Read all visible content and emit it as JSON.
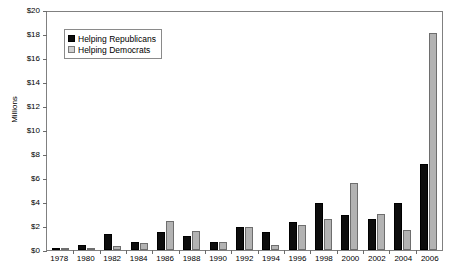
{
  "chart_data": {
    "type": "bar",
    "title": "",
    "xlabel": "",
    "ylabel": "Millions",
    "ylim": [
      0,
      20
    ],
    "ytick_labels": [
      "$0",
      "$2",
      "$4",
      "$6",
      "$8",
      "$10",
      "$12",
      "$14",
      "$16",
      "$18",
      "$20"
    ],
    "ytick_values": [
      0,
      2,
      4,
      6,
      8,
      10,
      12,
      14,
      16,
      18,
      20
    ],
    "grid": false,
    "legend_position": "top-left",
    "categories": [
      "1978",
      "1980",
      "1982",
      "1984",
      "1986",
      "1988",
      "1990",
      "1992",
      "1994",
      "1996",
      "1998",
      "2000",
      "2002",
      "2004",
      "2006"
    ],
    "series": [
      {
        "name": "Helping Republicans",
        "color": "#0d0d0d",
        "values": [
          0.15,
          0.45,
          1.35,
          0.7,
          1.5,
          1.15,
          0.7,
          1.9,
          1.5,
          2.3,
          3.95,
          2.9,
          2.6,
          3.9,
          7.2
        ]
      },
      {
        "name": "Helping Democrats",
        "color": "#b3b3b3",
        "values": [
          0.05,
          0.2,
          0.3,
          0.55,
          2.4,
          1.55,
          0.7,
          1.9,
          0.45,
          2.05,
          2.6,
          5.6,
          3.0,
          1.7,
          18.1
        ]
      }
    ]
  },
  "legend": {
    "items": [
      {
        "label": "Helping Republicans"
      },
      {
        "label": "Helping Democrats"
      }
    ]
  }
}
